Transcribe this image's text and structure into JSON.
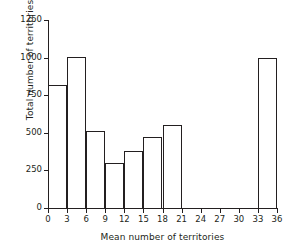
{
  "chart_data": {
    "type": "bar",
    "title": "",
    "subtitle": "",
    "xlabel": "Mean number of territories",
    "ylabel": "Total number of territories",
    "xlim": [
      0,
      36
    ],
    "ylim": [
      0,
      1250
    ],
    "grid": false,
    "legend": null,
    "bin_width": 3,
    "xticks": [
      0,
      3,
      6,
      9,
      12,
      15,
      18,
      21,
      24,
      27,
      30,
      33,
      36
    ],
    "xtick_labels": [
      "0",
      "3",
      "6",
      "9",
      "12",
      "15",
      "18",
      "21",
      "24",
      "27",
      "30",
      "33",
      "36"
    ],
    "yticks": [
      0,
      250,
      500,
      750,
      1000,
      1250
    ],
    "ytick_labels": [
      "0",
      "250",
      "500",
      "750",
      "1000",
      "1250"
    ],
    "bins": [
      {
        "x0": 0,
        "x1": 3,
        "value": 820
      },
      {
        "x0": 3,
        "x1": 6,
        "value": 1005
      },
      {
        "x0": 6,
        "x1": 9,
        "value": 510
      },
      {
        "x0": 9,
        "x1": 12,
        "value": 300
      },
      {
        "x0": 12,
        "x1": 15,
        "value": 380
      },
      {
        "x0": 15,
        "x1": 18,
        "value": 470
      },
      {
        "x0": 18,
        "x1": 21,
        "value": 550
      },
      {
        "x0": 21,
        "x1": 24,
        "value": 0
      },
      {
        "x0": 24,
        "x1": 27,
        "value": 0
      },
      {
        "x0": 27,
        "x1": 30,
        "value": 0
      },
      {
        "x0": 30,
        "x1": 33,
        "value": 0
      },
      {
        "x0": 33,
        "x1": 36,
        "value": 1000
      }
    ],
    "categories": [
      "0-3",
      "3-6",
      "6-9",
      "9-12",
      "12-15",
      "15-18",
      "18-21",
      "21-24",
      "24-27",
      "27-30",
      "30-33",
      "33-36"
    ],
    "values": [
      820,
      1005,
      510,
      300,
      380,
      470,
      550,
      0,
      0,
      0,
      0,
      1000
    ],
    "colors": {
      "bar_edge": "#231f20",
      "bar_fill": "none",
      "axis": "#231f20",
      "text": "#231f20",
      "background": "#ffffff"
    }
  }
}
